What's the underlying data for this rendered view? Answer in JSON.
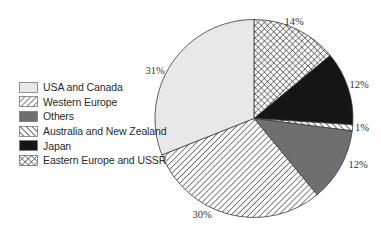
{
  "chart_data": {
    "type": "pie",
    "title": "",
    "start_angle": "12 o'clock",
    "direction": "clockwise",
    "legend_position": "left",
    "slices": [
      {
        "label": "Eastern Europe and USSR",
        "value": 14,
        "value_label": "14%",
        "fill": "crosshatch",
        "color": "#1a1a1a"
      },
      {
        "label": "Japan",
        "value": 12,
        "value_label": "12%",
        "fill": "solid",
        "color": "#151515"
      },
      {
        "label": "Australia and New Zealand",
        "value": 1,
        "value_label": "1%",
        "fill": "hatch-forward",
        "color": "#1a1a1a"
      },
      {
        "label": "Others",
        "value": 12,
        "value_label": "12%",
        "fill": "solid",
        "color": "#6f6f6f"
      },
      {
        "label": "Western Europe",
        "value": 30,
        "value_label": "30%",
        "fill": "hatch-back",
        "color": "#1a1a1a"
      },
      {
        "label": "USA and Canada",
        "value": 31,
        "value_label": "31%",
        "fill": "solid",
        "color": "#e8e8e8"
      }
    ],
    "legend_order": [
      "USA and Canada",
      "Western Europe",
      "Others",
      "Australia and New Zealand",
      "Japan",
      "Eastern Europe and USSR"
    ]
  },
  "legend": {
    "items": [
      {
        "label": "USA and Canada",
        "fill": "solid",
        "color": "#e8e8e8"
      },
      {
        "label": "Western Europe",
        "fill": "hatch-back",
        "color": "#1a1a1a"
      },
      {
        "label": "Others",
        "fill": "solid",
        "color": "#6f6f6f"
      },
      {
        "label": "Australia and New Zealand",
        "fill": "hatch-forward",
        "color": "#1a1a1a"
      },
      {
        "label": "Japan",
        "fill": "solid",
        "color": "#151515"
      },
      {
        "label": "Eastern Europe and USSR",
        "fill": "crosshatch",
        "color": "#1a1a1a"
      }
    ]
  },
  "layout": {
    "cx": 254,
    "cy": 118.5,
    "r": 99,
    "label_positions": [
      {
        "x": 294,
        "y": 25,
        "anchor": "middle"
      },
      {
        "x": 359,
        "y": 88,
        "anchor": "middle"
      },
      {
        "x": 362,
        "y": 131,
        "anchor": "middle"
      },
      {
        "x": 358,
        "y": 168,
        "anchor": "middle"
      },
      {
        "x": 202,
        "y": 218,
        "anchor": "middle"
      },
      {
        "x": 155,
        "y": 74,
        "anchor": "middle"
      }
    ]
  }
}
